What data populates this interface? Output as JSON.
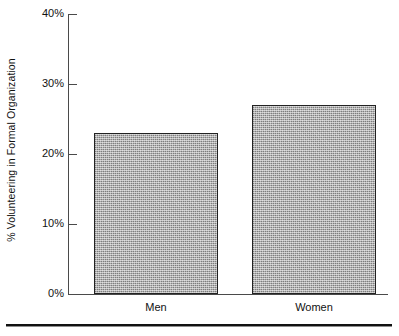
{
  "chart_data": {
    "type": "bar",
    "title": "",
    "subtitle": "",
    "categories": [
      "Men",
      "Women"
    ],
    "values": [
      23,
      27
    ],
    "series": [
      {
        "name": "% Volunteering in Formal Organization",
        "values": [
          23,
          27
        ]
      }
    ],
    "xlabel": "",
    "ylabel": "% Volunteering in Formal Organization",
    "ylim": [
      0,
      40
    ],
    "ytick_values": [
      0,
      10,
      20,
      30,
      40
    ],
    "ytick_labels": [
      "0%",
      "10%",
      "20%",
      "30%",
      "40%"
    ],
    "grid": false,
    "legend": false,
    "legend_position": "none",
    "bar_fill_color": "#ababab",
    "bar_edge_color": "#222222",
    "axis_color": "#4a4a4a",
    "text_color": "#111111",
    "background_color": "#ffffff",
    "annotations": []
  },
  "axis": {
    "y_title": "% Volunteering in Formal Organization",
    "ticks": [
      {
        "label": "40%",
        "value": 40
      },
      {
        "label": "30%",
        "value": 30
      },
      {
        "label": "20%",
        "value": 20
      },
      {
        "label": "10%",
        "value": 10
      },
      {
        "label": "0%",
        "value": 0
      }
    ]
  },
  "bars": [
    {
      "category": "Men",
      "value": 23,
      "value_label": "23%"
    },
    {
      "category": "Women",
      "value": 27,
      "value_label": "27%"
    }
  ],
  "footer": {
    "rule": ""
  }
}
